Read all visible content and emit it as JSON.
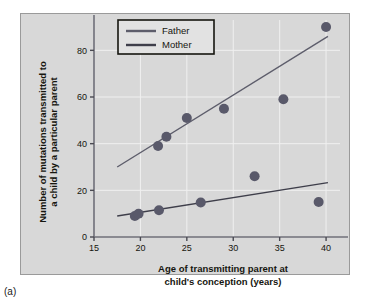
{
  "figure": {
    "caption": "(a)",
    "panel_bg": "#d8d8d8",
    "accent": "#5a5a66"
  },
  "chart_data": {
    "type": "scatter",
    "title": "",
    "xlabel_line1": "Age of transmitting parent at",
    "xlabel_line2": "child's conception (years)",
    "ylabel_line1": "Number of mutations transmitted to",
    "ylabel_line2": "a child by a particular parent",
    "xlim": [
      15,
      41.5
    ],
    "ylim": [
      0,
      93
    ],
    "xticks": [
      15,
      20,
      25,
      30,
      35,
      40
    ],
    "yticks": [
      0,
      20,
      40,
      60,
      80
    ],
    "xtick_labels": [
      "15",
      "20",
      "25",
      "30",
      "35",
      "40"
    ],
    "ytick_labels": [
      "0",
      "20",
      "40",
      "60",
      "80"
    ],
    "grid": true,
    "grid_color": "#f0f0f0",
    "legend_position": "top-left-inside",
    "marker_color": "#59596a",
    "marker_size": 5,
    "series": [
      {
        "name": "Father",
        "color": "#5d5d6b",
        "points": [
          {
            "x": 21.9,
            "y": 39
          },
          {
            "x": 22.8,
            "y": 43
          },
          {
            "x": 25.0,
            "y": 51
          },
          {
            "x": 29.0,
            "y": 55
          },
          {
            "x": 35.4,
            "y": 59
          },
          {
            "x": 40.0,
            "y": 90
          }
        ],
        "trend_line": {
          "x1": 17.5,
          "y1": 30,
          "x2": 40.2,
          "y2": 86
        }
      },
      {
        "name": "Mother",
        "color": "#3e3e4a",
        "points": [
          {
            "x": 19.4,
            "y": 9
          },
          {
            "x": 19.8,
            "y": 10
          },
          {
            "x": 22.0,
            "y": 11.5
          },
          {
            "x": 26.5,
            "y": 14.8
          },
          {
            "x": 32.3,
            "y": 26
          },
          {
            "x": 39.2,
            "y": 15
          }
        ],
        "trend_line": {
          "x1": 17.5,
          "y1": 9,
          "x2": 40.2,
          "y2": 23.3
        }
      }
    ]
  },
  "legend": {
    "items": [
      {
        "label": "Father",
        "color": "#5d5d6b"
      },
      {
        "label": "Mother",
        "color": "#3e3e4a"
      }
    ]
  }
}
